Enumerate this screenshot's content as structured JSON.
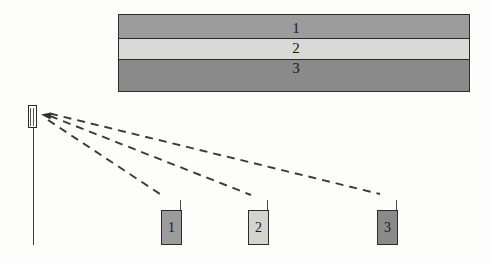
{
  "figure": {
    "background_color": "#fdfdfc",
    "line_color": "#2b2b2b"
  },
  "slab": {
    "name": "layered-slab",
    "border_color": "#2b2b2b",
    "bands": [
      {
        "label": "1",
        "fill": "#9c9c9c",
        "name": "layer-band-1"
      },
      {
        "label": "2",
        "fill": "#d9d9d5",
        "name": "layer-band-2"
      },
      {
        "label": "3",
        "fill": "#8a8a8a",
        "name": "layer-band-3"
      }
    ]
  },
  "emitter": {
    "name": "emitter-probe",
    "box_fill": "#ffffff",
    "pole_color": "#3a3a3a"
  },
  "receivers": [
    {
      "label": "1",
      "fill": "#9c9c9c",
      "name": "receiver-1"
    },
    {
      "label": "2",
      "fill": "#d4d4cf",
      "name": "receiver-2"
    },
    {
      "label": "3",
      "fill": "#8a8a8a",
      "name": "receiver-3"
    }
  ],
  "rays": {
    "style": "dashed",
    "color": "#3a3a3a",
    "arrowhead": "left-pointing-filled-triangle",
    "paths": [
      {
        "name": "ray-to-receiver-1",
        "from_x": 46,
        "from_y": 119,
        "to_x": 163,
        "to_y": 196
      },
      {
        "name": "ray-to-receiver-2",
        "from_x": 46,
        "from_y": 116,
        "to_x": 251,
        "to_y": 195
      },
      {
        "name": "ray-to-receiver-3",
        "from_x": 46,
        "from_y": 114,
        "to_x": 380,
        "to_y": 194
      }
    ]
  }
}
